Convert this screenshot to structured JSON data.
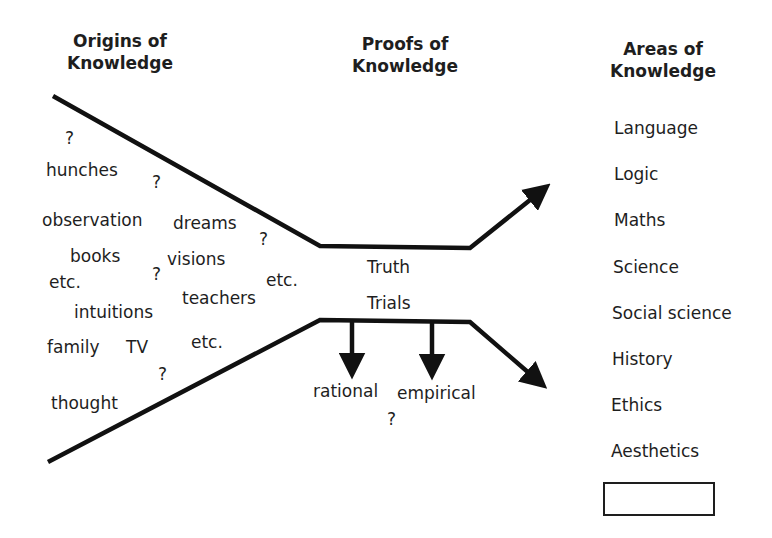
{
  "headers": {
    "origins": [
      "Origins of",
      "Knowledge"
    ],
    "proofs": [
      "Proofs of",
      "Knowledge"
    ],
    "areas": [
      "Areas of",
      "Knowledge"
    ]
  },
  "origins_items": [
    {
      "label": "?",
      "x": 65,
      "y": 130
    },
    {
      "label": "hunches",
      "x": 46,
      "y": 162
    },
    {
      "label": "?",
      "x": 152,
      "y": 174
    },
    {
      "label": "observation",
      "x": 42,
      "y": 212
    },
    {
      "label": "dreams",
      "x": 173,
      "y": 215
    },
    {
      "label": "?",
      "x": 259,
      "y": 231
    },
    {
      "label": "books",
      "x": 70,
      "y": 248
    },
    {
      "label": "visions",
      "x": 167,
      "y": 251
    },
    {
      "label": "etc.",
      "x": 49,
      "y": 274
    },
    {
      "label": "?",
      "x": 152,
      "y": 266
    },
    {
      "label": "etc.",
      "x": 266,
      "y": 272
    },
    {
      "label": "teachers",
      "x": 182,
      "y": 290
    },
    {
      "label": "intuitions",
      "x": 74,
      "y": 304
    },
    {
      "label": "family",
      "x": 47,
      "y": 339
    },
    {
      "label": "TV",
      "x": 126,
      "y": 339
    },
    {
      "label": "etc.",
      "x": 191,
      "y": 334
    },
    {
      "label": "?",
      "x": 158,
      "y": 366
    },
    {
      "label": "thought",
      "x": 51,
      "y": 395
    }
  ],
  "proofs_items": {
    "truth": "Truth",
    "trials": "Trials",
    "rational": "rational",
    "empirical": "empirical",
    "question": "?"
  },
  "areas_items": [
    "Language",
    "Logic",
    "Maths",
    "Science",
    "Social science",
    "History",
    "Ethics",
    "Aesthetics"
  ],
  "blank_box": ""
}
